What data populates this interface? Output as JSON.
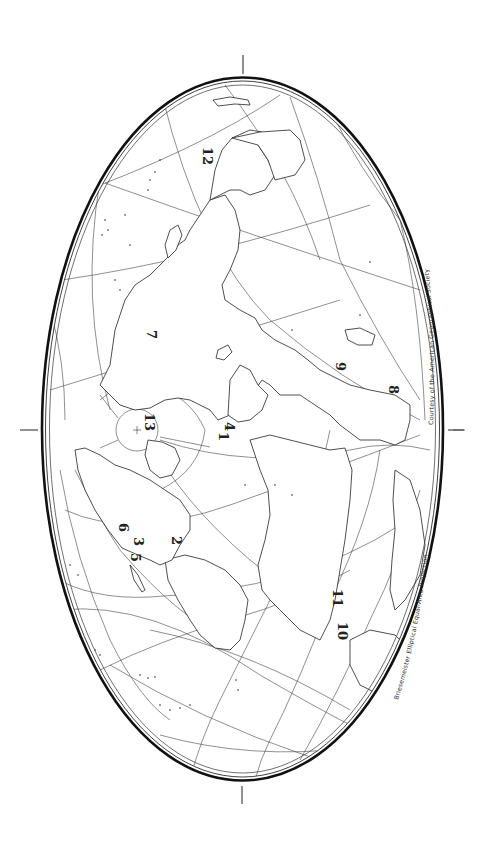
{
  "map": {
    "title": "Briesemeister Elliptical Equal-Area Projection",
    "credit": "Courtesy of the American Geographical Society",
    "projection": "Briesemeister elliptical equal-area",
    "orientation": "rotated 90 degrees (north pole near left-center)",
    "colors": {
      "background": "#ffffff",
      "ink": "#222222",
      "border": "#111111"
    },
    "labels": [
      {
        "id": "1",
        "text": "1"
      },
      {
        "id": "2",
        "text": "2"
      },
      {
        "id": "3",
        "text": "3"
      },
      {
        "id": "4",
        "text": "4"
      },
      {
        "id": "5",
        "text": "5"
      },
      {
        "id": "6",
        "text": "6"
      },
      {
        "id": "7",
        "text": "7"
      },
      {
        "id": "8",
        "text": "8"
      },
      {
        "id": "9",
        "text": "9"
      },
      {
        "id": "10",
        "text": "10"
      },
      {
        "id": "11",
        "text": "11"
      },
      {
        "id": "12",
        "text": "12"
      },
      {
        "id": "13",
        "text": "13"
      }
    ]
  }
}
